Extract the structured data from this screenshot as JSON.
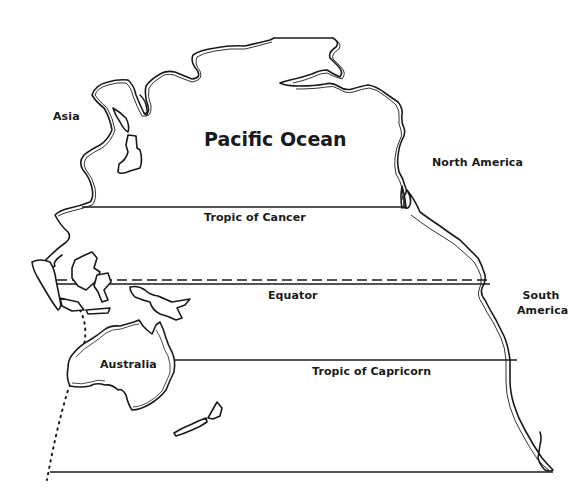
{
  "map": {
    "title": "Pacific Ocean",
    "background_color": "#ffffff",
    "ink_color": "#1a1a1a",
    "style": "black-and-white outline map",
    "labels": {
      "ocean": "Pacific Ocean",
      "asia": "Asia",
      "north_america": "North America",
      "south_america_line1": "South",
      "south_america_line2": "America",
      "australia": "Australia"
    },
    "lines_of_latitude": [
      {
        "name": "Tropic of Cancer",
        "label": "Tropic of Cancer",
        "style": "solid"
      },
      {
        "name": "Equator",
        "label": "Equator",
        "style": "double: dashed above, solid below"
      },
      {
        "name": "Tropic of Capricorn",
        "label": "Tropic of Capricorn",
        "style": "solid"
      }
    ],
    "other_lines": [
      {
        "name": "northern-boundary-line",
        "style": "solid"
      },
      {
        "name": "southern-boundary-line",
        "style": "solid"
      },
      {
        "name": "western-boundary-curve",
        "style": "dotted"
      }
    ],
    "landmasses": [
      "Asia",
      "North America",
      "South America",
      "Australia",
      "Indonesia/Philippines islands",
      "New Guinea",
      "New Zealand",
      "Japan",
      "Alaska"
    ]
  }
}
